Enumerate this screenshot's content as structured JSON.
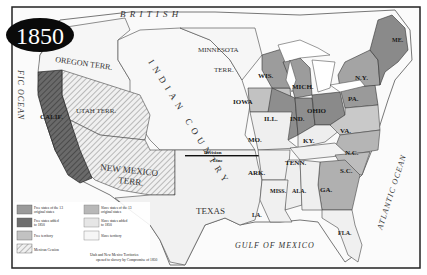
{
  "title": {
    "year": "1850"
  },
  "colors": {
    "free_original": "#9a9a9a",
    "free_added": "#6e6e6e",
    "free_territory": "#c2c2c2",
    "slave_original": "#b8b8b8",
    "slave_added": "#e6e6e6",
    "slave_territory": "#f4f4f4",
    "water": "#ffffff",
    "border": "#222222"
  },
  "regions": {
    "british": "B R I T I S H",
    "oregon": "OREGON TERR.",
    "minnesota": "MINNESOTA",
    "minnesota_terr": "TERR.",
    "indian_country": "INDIAN COUNTRY",
    "utah": "UTAH TERR.",
    "calif": "CALIF.",
    "new_mexico_1": "NEW MEXICO",
    "new_mexico_2": "TERR.",
    "texas": "TEXAS",
    "division_1": "Division",
    "division_2": "Line"
  },
  "states": {
    "wis": "WIS.",
    "mich": "MICH.",
    "iowa": "IOWA",
    "ill": "ILL.",
    "ind": "IND.",
    "ohio": "OHIO",
    "pa": "PA.",
    "ny": "N.Y.",
    "me": "ME.",
    "mo": "MO.",
    "ky": "KY.",
    "va": "VA.",
    "nc": "N.C.",
    "tenn": "TENN.",
    "sc": "S.C.",
    "ark": "ARK.",
    "miss": "MISS.",
    "ala": "ALA.",
    "ga": "GA.",
    "la": "LA.",
    "fla": "FLA."
  },
  "oceans": {
    "pacific": "FIC OCEAN",
    "atlantic": "ATLANTIC OCEAN",
    "gulf": "GULF OF MEXICO"
  },
  "legend": {
    "items": [
      {
        "label_1": "Free states of the 13",
        "label_2": "original states"
      },
      {
        "label_1": "Free states added",
        "label_2": "to 1850"
      },
      {
        "label_1": "Free territory",
        "label_2": ""
      },
      {
        "label_1": "Mexican Cession",
        "label_2": ""
      },
      {
        "label_1": "Slave states of the 13",
        "label_2": "original states"
      },
      {
        "label_1": "Slave states added",
        "label_2": "to 1850"
      },
      {
        "label_1": "Slave territory",
        "label_2": ""
      }
    ],
    "note_1": "Utah and New Mexico Territories",
    "note_2": "opened to slavery by Compromise of 1850"
  }
}
